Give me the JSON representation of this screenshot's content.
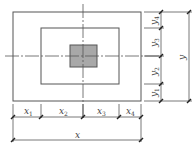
{
  "diagram": {
    "type": "plan-view dimension diagram",
    "colors": {
      "line": "#555555",
      "fill_center": "#a8a8a8",
      "background": "#ffffff"
    },
    "horizontal_dims": {
      "segments": [
        {
          "base": "x",
          "sub": "1"
        },
        {
          "base": "x",
          "sub": "2"
        },
        {
          "base": "x",
          "sub": "3"
        },
        {
          "base": "x",
          "sub": "4"
        }
      ],
      "total": "x"
    },
    "vertical_dims": {
      "segments": [
        {
          "base": "y",
          "sub": "4"
        },
        {
          "base": "y",
          "sub": "3"
        },
        {
          "base": "y",
          "sub": "2"
        },
        {
          "base": "y",
          "sub": "1"
        }
      ],
      "total": "y"
    }
  }
}
